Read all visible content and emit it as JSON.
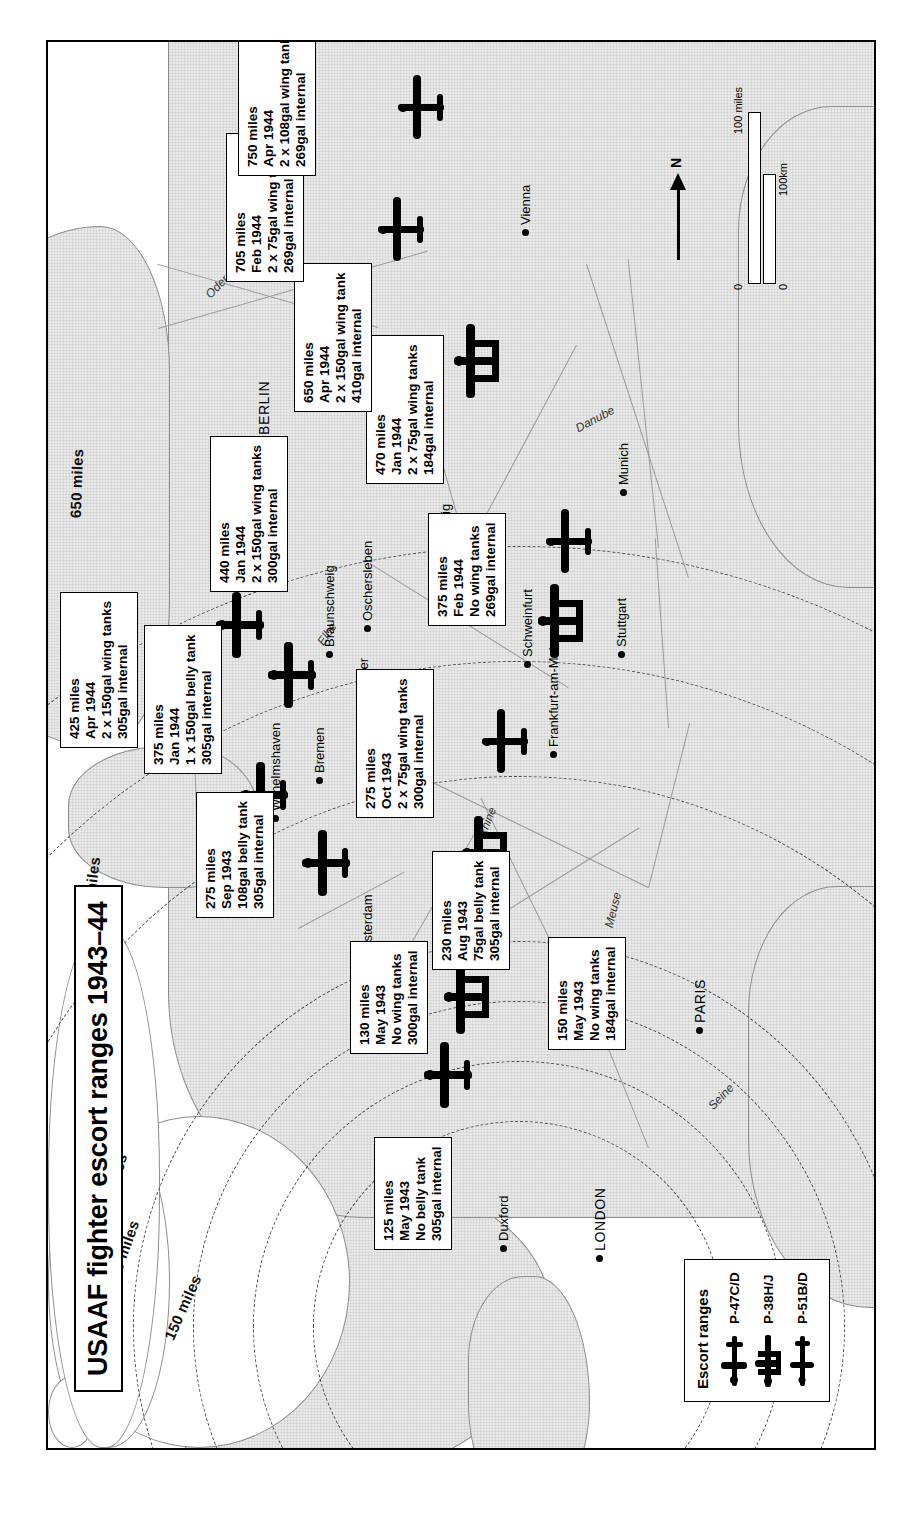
{
  "title": "USAAF fighter escort ranges 1943–44",
  "legend": {
    "heading": "Escort ranges",
    "items": [
      {
        "label": "P-47C/D",
        "icon": "single-engine-fighter-icon"
      },
      {
        "label": "P-38H/J",
        "icon": "twin-boom-fighter-icon"
      },
      {
        "label": "P-51B/D",
        "icon": "single-engine-mustang-icon"
      }
    ]
  },
  "scale": {
    "miles_label": "100 miles",
    "km_label": "100km",
    "zero_miles": "0",
    "zero_km": "0"
  },
  "compass": {
    "label": "N"
  },
  "range_rings": [
    {
      "label": "150 miles"
    },
    {
      "label": "200 miles"
    },
    {
      "label": "250 miles"
    },
    {
      "label": "300 miles"
    },
    {
      "label": "450 miles"
    },
    {
      "label": "550 miles"
    },
    {
      "label": "650 miles"
    }
  ],
  "cities": [
    {
      "name": "LONDON",
      "caps": true
    },
    {
      "name": "Duxford",
      "caps": false
    },
    {
      "name": "PARIS",
      "caps": true
    },
    {
      "name": "Amsterdam",
      "caps": false
    },
    {
      "name": "Wilhelmshaven",
      "caps": false
    },
    {
      "name": "Bremen",
      "caps": false
    },
    {
      "name": "Hanover",
      "caps": false
    },
    {
      "name": "Braunschweig",
      "caps": false
    },
    {
      "name": "Oschersleben",
      "caps": false
    },
    {
      "name": "BERLIN",
      "caps": true
    },
    {
      "name": "Leipzig",
      "caps": false
    },
    {
      "name": "Prague",
      "caps": false
    },
    {
      "name": "Schweinfurt",
      "caps": false
    },
    {
      "name": "Frankfurt-am-Main",
      "caps": false
    },
    {
      "name": "Stuttgart",
      "caps": false
    },
    {
      "name": "Munich",
      "caps": false
    },
    {
      "name": "Vienna",
      "caps": false
    }
  ],
  "water_labels": [
    {
      "name": "Seine"
    },
    {
      "name": "Meuse"
    },
    {
      "name": "Rhine"
    },
    {
      "name": "Elbe"
    },
    {
      "name": "Oder"
    },
    {
      "name": "Danube"
    }
  ],
  "annotations": [
    {
      "id": "p47-may-1943",
      "range": "125 miles",
      "date": "May 1943",
      "tanks": "No belly tank",
      "internal": "305gal internal"
    },
    {
      "id": "p38-may-1943",
      "range": "130 miles",
      "date": "May 1943",
      "tanks": "No wing tanks",
      "internal": "300gal internal"
    },
    {
      "id": "p51-may-1943",
      "range": "150 miles",
      "date": "May 1943",
      "tanks": "No wing tanks",
      "internal": "184gal internal"
    },
    {
      "id": "p47-aug-1943",
      "range": "230 miles",
      "date": "Aug 1943",
      "tanks": "75gal belly tank",
      "internal": "305gal internal"
    },
    {
      "id": "p47-sep-1943",
      "range": "275 miles",
      "date": "Sep 1943",
      "tanks": "108gal belly tank",
      "internal": "305gal internal"
    },
    {
      "id": "p38-oct-1943",
      "range": "275 miles",
      "date": "Oct 1943",
      "tanks": "2 x 75gal wing tanks",
      "internal": "300gal internal"
    },
    {
      "id": "p47-jan-1944",
      "range": "375 miles",
      "date": "Jan 1944",
      "tanks": "1 x 150gal belly tank",
      "internal": "305gal internal"
    },
    {
      "id": "p51-feb-1944",
      "range": "375 miles",
      "date": "Feb 1944",
      "tanks": "No wing tanks",
      "internal": "269gal internal"
    },
    {
      "id": "p47-apr-1944",
      "range": "425 miles",
      "date": "Apr 1944",
      "tanks": "2 x 150gal wing tanks",
      "internal": "305gal internal"
    },
    {
      "id": "p38-jan-1944",
      "range": "440 miles",
      "date": "Jan 1944",
      "tanks": "2 x 150gal wing tanks",
      "internal": "300gal internal"
    },
    {
      "id": "p51-jan-1944",
      "range": "470 miles",
      "date": "Jan 1944",
      "tanks": "2 x 75gal wing tanks",
      "internal": "184gal internal"
    },
    {
      "id": "p38-apr-1944",
      "range": "650 miles",
      "date": "Apr 1944",
      "tanks": "2 x 150gal wing tank",
      "internal": "410gal internal"
    },
    {
      "id": "p51-feb-1944-b",
      "range": "705 miles",
      "date": "Feb 1944",
      "tanks": "2 x 75gal wing tanks",
      "internal": "269gal internal"
    },
    {
      "id": "p51-apr-1944",
      "range": "750 miles",
      "date": "Apr 1944",
      "tanks": "2 x 108gal wing tanks",
      "internal": "269gal internal"
    }
  ],
  "colors": {
    "land": "#e9e9e9",
    "sea": "#ffffff",
    "ink": "#000000",
    "coast": "#8d8d8d"
  }
}
